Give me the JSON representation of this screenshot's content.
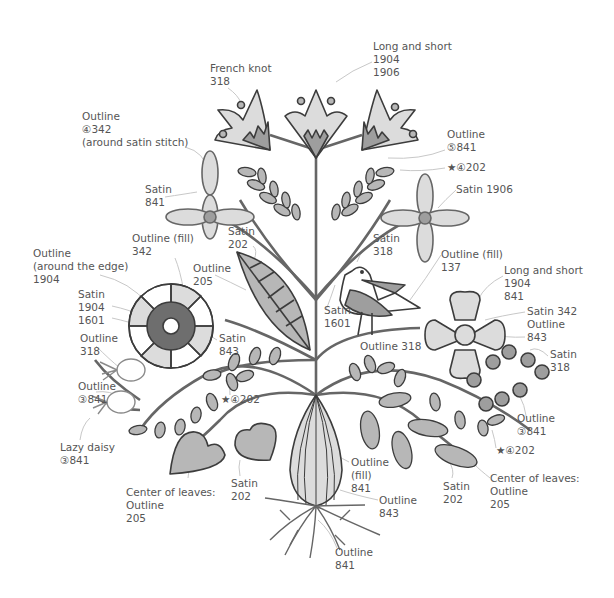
{
  "diagram": {
    "colors": {
      "stroke": "#3c3c3c",
      "light_fill": "#dcdcdc",
      "mid_fill": "#b7b7b7",
      "dark_fill": "#6e6e6e",
      "leader": "#bdbdbd",
      "label_text": "#555555"
    },
    "labels": [
      {
        "id": "french-knot",
        "lines": [
          "French knot",
          "318"
        ],
        "x": 210,
        "y": 62
      },
      {
        "id": "long-short-top",
        "lines": [
          "Long and short",
          "1904",
          "1906"
        ],
        "x": 373,
        "y": 40
      },
      {
        "id": "outline-4-342",
        "lines": [
          "Outline",
          "④342",
          "(around satin stitch)"
        ],
        "x": 82,
        "y": 110
      },
      {
        "id": "outline-5-841",
        "lines": [
          "Outline",
          "⑤841"
        ],
        "x": 447,
        "y": 128
      },
      {
        "id": "star-4-202-top",
        "lines": [
          "★④202"
        ],
        "x": 447,
        "y": 161
      },
      {
        "id": "satin-841",
        "lines": [
          "Satin",
          "841"
        ],
        "x": 145,
        "y": 183
      },
      {
        "id": "satin-1906",
        "lines": [
          "Satin 1906"
        ],
        "x": 456,
        "y": 183
      },
      {
        "id": "outline-fill-342",
        "lines": [
          "Outline (fill)",
          "342"
        ],
        "x": 132,
        "y": 232
      },
      {
        "id": "satin-202-top",
        "lines": [
          "Satin",
          "202"
        ],
        "x": 228,
        "y": 225
      },
      {
        "id": "satin-318-top",
        "lines": [
          "Satin",
          "318"
        ],
        "x": 373,
        "y": 232
      },
      {
        "id": "outline-fill-137",
        "lines": [
          "Outline (fill)",
          "137"
        ],
        "x": 441,
        "y": 248
      },
      {
        "id": "outline-around-edge",
        "lines": [
          "Outline",
          "(around the edge)",
          "1904"
        ],
        "x": 33,
        "y": 247
      },
      {
        "id": "outline-205-top",
        "lines": [
          "Outline",
          "205"
        ],
        "x": 193,
        "y": 262
      },
      {
        "id": "long-short-right",
        "lines": [
          "Long and short",
          "1904",
          "841"
        ],
        "x": 504,
        "y": 264
      },
      {
        "id": "satin-1904-1601",
        "lines": [
          "Satin",
          "1904",
          "1601"
        ],
        "x": 78,
        "y": 288
      },
      {
        "id": "satin-1601",
        "lines": [
          "Satin",
          "1601"
        ],
        "x": 324,
        "y": 304
      },
      {
        "id": "satin-342-outline-843",
        "lines": [
          "Satin 342",
          "Outline",
          "843"
        ],
        "x": 527,
        "y": 305
      },
      {
        "id": "outline-318-left",
        "lines": [
          "Outline",
          "318"
        ],
        "x": 80,
        "y": 332
      },
      {
        "id": "satin-843",
        "lines": [
          "Satin",
          "843"
        ],
        "x": 219,
        "y": 332
      },
      {
        "id": "outline-318-mid",
        "lines": [
          "Outline 318"
        ],
        "x": 360,
        "y": 340
      },
      {
        "id": "satin-318-right",
        "lines": [
          "Satin",
          "318"
        ],
        "x": 550,
        "y": 348
      },
      {
        "id": "outline-3-841-left",
        "lines": [
          "Outline",
          "③841"
        ],
        "x": 78,
        "y": 380
      },
      {
        "id": "star-4-202-left",
        "lines": [
          "★④202"
        ],
        "x": 221,
        "y": 393
      },
      {
        "id": "outline-3-841-right",
        "lines": [
          "Outline",
          "③841"
        ],
        "x": 517,
        "y": 412
      },
      {
        "id": "lazy-daisy",
        "lines": [
          "Lazy daisy",
          "③841"
        ],
        "x": 60,
        "y": 441
      },
      {
        "id": "star-4-202-right",
        "lines": [
          "★④202"
        ],
        "x": 496,
        "y": 444
      },
      {
        "id": "outline-fill-841",
        "lines": [
          "Outline",
          "(fill)",
          "841"
        ],
        "x": 351,
        "y": 456
      },
      {
        "id": "satin-202-left",
        "lines": [
          "Satin",
          "202"
        ],
        "x": 231,
        "y": 477
      },
      {
        "id": "satin-202-right",
        "lines": [
          "Satin",
          "202"
        ],
        "x": 443,
        "y": 480
      },
      {
        "id": "center-of-leaves-right",
        "lines": [
          "Center of leaves:",
          "Outline",
          "205"
        ],
        "x": 490,
        "y": 472
      },
      {
        "id": "center-of-leaves-left",
        "lines": [
          "Center of leaves:",
          "Outline",
          "205"
        ],
        "x": 126,
        "y": 486
      },
      {
        "id": "outline-843-bottom",
        "lines": [
          "Outline",
          "843"
        ],
        "x": 379,
        "y": 494
      },
      {
        "id": "outline-841-bottom",
        "lines": [
          "Outline",
          "841"
        ],
        "x": 335,
        "y": 546
      }
    ]
  }
}
